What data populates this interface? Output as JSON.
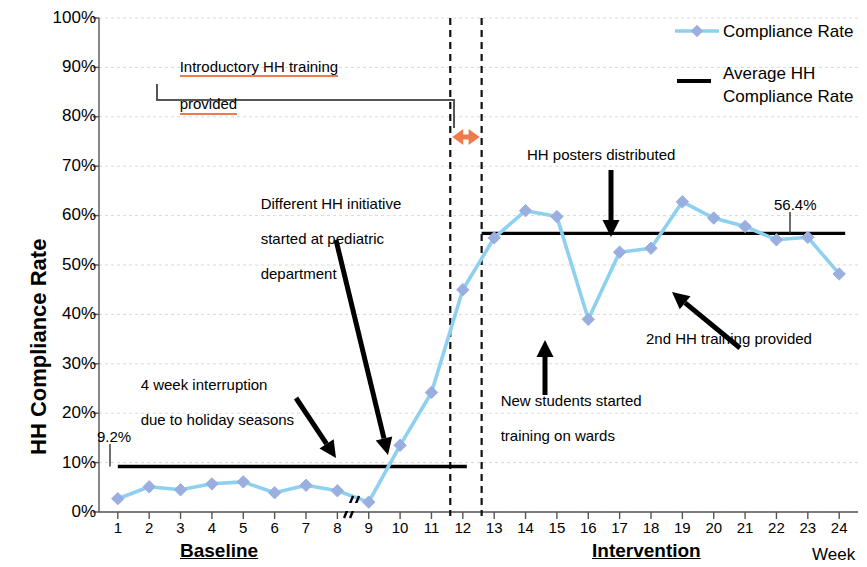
{
  "chart_data": {
    "type": "line",
    "title": "",
    "xlabel": "Week",
    "ylabel": "HH Compliance Rate",
    "xlim": [
      0.4,
      24.6
    ],
    "ylim": [
      0,
      1.0
    ],
    "ytick_labels": [
      "0%",
      "10%",
      "20%",
      "30%",
      "40%",
      "50%",
      "60%",
      "70%",
      "80%",
      "90%",
      "100%"
    ],
    "ytick_values": [
      0,
      10,
      20,
      30,
      40,
      50,
      60,
      70,
      80,
      90,
      100
    ],
    "xtick_labels": [
      "1",
      "2",
      "3",
      "4",
      "5",
      "6",
      "7",
      "8",
      "9",
      "10",
      "11",
      "12",
      "13",
      "14",
      "15",
      "16",
      "17",
      "18",
      "19",
      "20",
      "21",
      "22",
      "23",
      "24"
    ],
    "grid": true,
    "legend_position": "top-right",
    "series": [
      {
        "name": "Compliance Rate",
        "color": "#9aafe0",
        "line_color": "#8ed0f0",
        "marker": "diamond",
        "x": [
          1,
          2,
          3,
          4,
          5,
          6,
          7,
          8,
          9,
          10,
          11,
          12,
          13,
          14,
          15,
          16,
          17,
          18,
          19,
          20,
          21,
          22,
          23,
          24
        ],
        "values": [
          2.7,
          5.1,
          4.5,
          5.7,
          6.1,
          3.9,
          5.4,
          4.3,
          2.0,
          13.5,
          24.2,
          45.0,
          55.5,
          61.0,
          59.8,
          39.0,
          52.6,
          53.4,
          62.8,
          59.5,
          57.8,
          55.1,
          55.6,
          48.2
        ]
      },
      {
        "name": "Average HH Compliance Rate",
        "color": "#000000",
        "marker": "none",
        "segments": [
          {
            "label": "9.2%",
            "value": 9.2,
            "x_start": 1,
            "x_end": 12
          },
          {
            "label": "56.4%",
            "value": 56.4,
            "x_start": 12.6,
            "x_end": 24
          }
        ]
      }
    ],
    "phase_labels": [
      {
        "text": "Baseline",
        "x_center": 6.5
      },
      {
        "text": "Intervention",
        "x_center": 18.0
      }
    ],
    "vertical_markers": [
      {
        "x": 11.6,
        "style": "dashed"
      },
      {
        "x": 12.6,
        "style": "dashed"
      }
    ],
    "axis_break": {
      "between_x": [
        8,
        9
      ],
      "note": "4 week interruption"
    },
    "value_labels": [
      {
        "text": "9.2%",
        "value": 9.2
      },
      {
        "text": "56.4%",
        "value": 56.4
      }
    ],
    "annotations": [
      {
        "id": "intro-training",
        "text": "Introductory HH training\nprovided",
        "underline_color": "#ef7a4d"
      },
      {
        "id": "pediatric-initiative",
        "text": "Different HH initiative\nstarted at pediatric\ndepartment",
        "points_to_x": 9
      },
      {
        "id": "holiday-interruption",
        "text": "4 week interruption\ndue to holiday seasons",
        "points_to_x": 8.5
      },
      {
        "id": "posters",
        "text": "HH posters distributed",
        "points_to_x": 17
      },
      {
        "id": "new-students",
        "text": "New students started\ntraining on wards",
        "points_to_x": 16
      },
      {
        "id": "second-training",
        "text": "2nd HH training provided",
        "points_to_x": 21
      }
    ]
  },
  "yaxis": {
    "title": "HH Compliance Rate",
    "ticks": [
      "100%",
      "90%",
      "80%",
      "70%",
      "60%",
      "50%",
      "40%",
      "30%",
      "20%",
      "10%",
      "0%"
    ]
  },
  "xaxis": {
    "title": "Week",
    "ticks": [
      "1",
      "2",
      "3",
      "4",
      "5",
      "6",
      "7",
      "8",
      "9",
      "10",
      "11",
      "12",
      "13",
      "14",
      "15",
      "16",
      "17",
      "18",
      "19",
      "20",
      "21",
      "22",
      "23",
      "24"
    ],
    "phase_baseline": "Baseline",
    "phase_intervention": "Intervention"
  },
  "legend": {
    "item1": "Compliance Rate",
    "item2_line1": "Average HH",
    "item2_line2": "Compliance Rate"
  },
  "annotations": {
    "intro_training_l1": "Introductory HH training",
    "intro_training_l2": "provided",
    "pediatric_l1": "Different HH initiative",
    "pediatric_l2": "started at pediatric",
    "pediatric_l3": "department",
    "holiday_l1": "4 week interruption",
    "holiday_l2": "due to holiday seasons",
    "posters": "HH posters distributed",
    "students_l1": "New students started",
    "students_l2": "training on wards",
    "second_training": "2nd HH training provided",
    "baseline_avg": "9.2%",
    "intervention_avg": "56.4%"
  },
  "colors": {
    "marker": "#8f9fd4",
    "line": "#9ed6f2",
    "average": "#000000",
    "accent_orange": "#ef7a4d",
    "grid": "#d9d9d9"
  }
}
